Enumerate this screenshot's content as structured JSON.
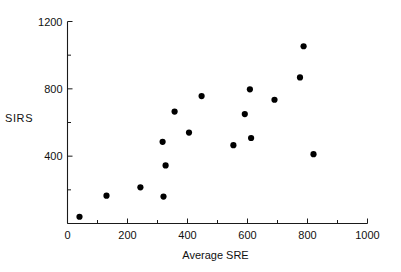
{
  "chart_data": {
    "type": "scatter",
    "title": "",
    "xlabel": "Average SRE",
    "ylabel": "SIRS",
    "xlim": [
      0,
      1000
    ],
    "ylim": [
      0,
      1200
    ],
    "grid": false,
    "legend": null,
    "x_major_ticks": [
      0,
      200,
      400,
      600,
      800,
      1000
    ],
    "x_minor_ticks": [
      100,
      300,
      500,
      700,
      900
    ],
    "y_major_ticks": [
      400,
      800,
      1200
    ],
    "y_minor_ticks": [
      200,
      600,
      1000
    ],
    "x_tick_labels": [
      "0",
      "200",
      "400",
      "600",
      "800",
      "1000"
    ],
    "y_tick_labels": [
      "400",
      "800",
      "1200"
    ],
    "marker": "filled-circle",
    "marker_color": "#000000",
    "marker_size_px": 5,
    "points": [
      {
        "x": 40,
        "y": 40
      },
      {
        "x": 130,
        "y": 165
      },
      {
        "x": 243,
        "y": 215
      },
      {
        "x": 320,
        "y": 160
      },
      {
        "x": 317,
        "y": 485
      },
      {
        "x": 327,
        "y": 345
      },
      {
        "x": 357,
        "y": 665
      },
      {
        "x": 405,
        "y": 540
      },
      {
        "x": 447,
        "y": 757
      },
      {
        "x": 553,
        "y": 465
      },
      {
        "x": 591,
        "y": 650
      },
      {
        "x": 608,
        "y": 797
      },
      {
        "x": 612,
        "y": 508
      },
      {
        "x": 690,
        "y": 735
      },
      {
        "x": 775,
        "y": 868
      },
      {
        "x": 787,
        "y": 1053
      },
      {
        "x": 820,
        "y": 412
      }
    ]
  },
  "axes": {
    "x_axis_name": "x-axis",
    "y_axis_name": "y-axis"
  }
}
